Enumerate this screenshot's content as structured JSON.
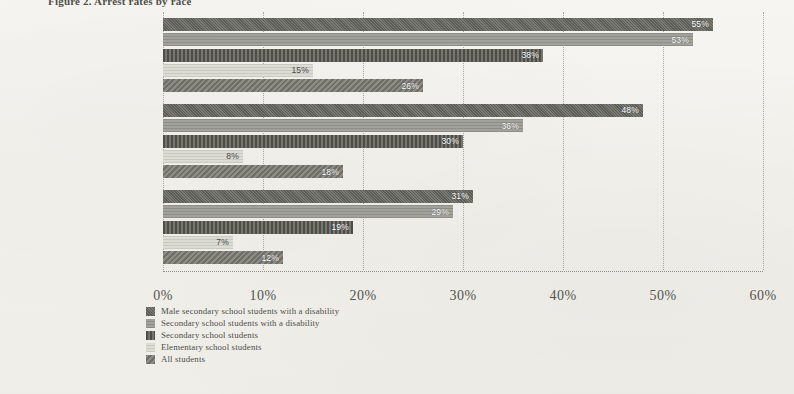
{
  "figure": {
    "title": "Figure 2.  Arrest rates by race"
  },
  "chart_data": {
    "type": "bar",
    "orientation": "horizontal",
    "title": "Figure 2.  Arrest rates by race",
    "xlabel": "",
    "ylabel": "",
    "xlim": [
      0,
      60
    ],
    "xticks": [
      0,
      10,
      20,
      30,
      40,
      50,
      60
    ],
    "xtick_labels": [
      "0%",
      "10%",
      "20%",
      "30%",
      "40%",
      "50%",
      "60%"
    ],
    "grid": true,
    "legend_position": "bottom-left",
    "categories": [
      "African Americans",
      "Latinos",
      "Whites"
    ],
    "series": [
      {
        "name": "Male secondary school students with a disability",
        "values": [
          55,
          48,
          31
        ],
        "labels": [
          "55%",
          "48%",
          "31%"
        ],
        "swatch": "s0"
      },
      {
        "name": "Secondary school students with a disability",
        "values": [
          53,
          36,
          29
        ],
        "labels": [
          "53%",
          "36%",
          "29%"
        ],
        "swatch": "s1"
      },
      {
        "name": "Secondary school students",
        "values": [
          38,
          30,
          19
        ],
        "labels": [
          "38%",
          "30%",
          "19%"
        ],
        "swatch": "s2"
      },
      {
        "name": "Elementary school students",
        "values": [
          15,
          8,
          7
        ],
        "labels": [
          "15%",
          "8%",
          "7%"
        ],
        "swatch": "s3"
      },
      {
        "name": "All students",
        "values": [
          26,
          18,
          12
        ],
        "labels": [
          "26%",
          "18%",
          "12%"
        ],
        "swatch": "s4"
      }
    ]
  }
}
